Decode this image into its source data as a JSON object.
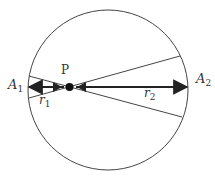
{
  "diagram": {
    "labels": {
      "point": "P",
      "left_point": "A",
      "left_point_sub": "1",
      "right_point": "A",
      "right_point_sub": "2",
      "r1": "r",
      "r1_sub": "1",
      "r2": "r",
      "r2_sub": "2"
    },
    "colors": {
      "stroke": "#333333",
      "arrow": "#222222",
      "background": "#ffffff"
    }
  }
}
